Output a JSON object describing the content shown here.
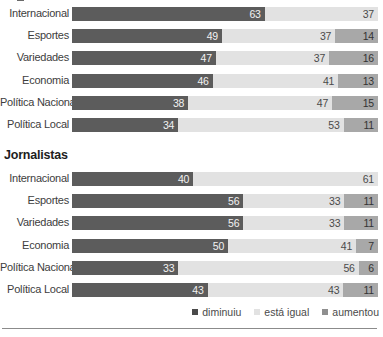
{
  "chart_data": {
    "type": "bar",
    "subtype": "stacked-horizontal-100",
    "title": "",
    "xlabel": "",
    "ylabel": "",
    "xlim": [
      0,
      100
    ],
    "grid": false,
    "legend_position": "bottom-right",
    "series": [
      {
        "name": "diminuiu",
        "key": "diminuiu",
        "color": "#5c5c5c"
      },
      {
        "name": "está igual",
        "key": "esta_igual",
        "color": "#e2e2e2"
      },
      {
        "name": "aumentou",
        "key": "aumentou",
        "color": "#a8a8a8"
      }
    ],
    "groups": [
      {
        "heading": "",
        "categories": [
          "Internacional",
          "Esportes",
          "Variedades",
          "Economia",
          "Política Nacional",
          "Política Local"
        ],
        "rows": [
          {
            "category": "Internacional",
            "diminuiu": 63,
            "esta_igual": 37,
            "aumentou": null
          },
          {
            "category": "Esportes",
            "diminuiu": 49,
            "esta_igual": 37,
            "aumentou": 14
          },
          {
            "category": "Variedades",
            "diminuiu": 47,
            "esta_igual": 37,
            "aumentou": 16
          },
          {
            "category": "Economia",
            "diminuiu": 46,
            "esta_igual": 41,
            "aumentou": 13
          },
          {
            "category": "Política Nacional",
            "diminuiu": 38,
            "esta_igual": 47,
            "aumentou": 15
          },
          {
            "category": "Política Local",
            "diminuiu": 34,
            "esta_igual": 53,
            "aumentou": 11
          }
        ]
      },
      {
        "heading": "Jornalistas",
        "categories": [
          "Internacional",
          "Esportes",
          "Variedades",
          "Economia",
          "Política Nacional",
          "Política Local"
        ],
        "rows": [
          {
            "category": "Internacional",
            "diminuiu": 40,
            "esta_igual": 61,
            "aumentou": null
          },
          {
            "category": "Esportes",
            "diminuiu": 56,
            "esta_igual": 33,
            "aumentou": 11
          },
          {
            "category": "Variedades",
            "diminuiu": 56,
            "esta_igual": 33,
            "aumentou": 11
          },
          {
            "category": "Economia",
            "diminuiu": 50,
            "esta_igual": 41,
            "aumentou": 7
          },
          {
            "category": "Política Nacional",
            "diminuiu": 33,
            "esta_igual": 56,
            "aumentou": 6
          },
          {
            "category": "Política Local",
            "diminuiu": 43,
            "esta_igual": 43,
            "aumentou": 11
          }
        ]
      }
    ]
  },
  "legend": {
    "items": [
      {
        "label": "diminuiu",
        "swatch": "legend-swatch-diminuiu"
      },
      {
        "label": "está igual",
        "swatch": "legend-swatch-esta-igual"
      },
      {
        "label": "aumentou",
        "swatch": "legend-swatch-aumentou"
      }
    ]
  },
  "group_headings": {
    "group_1": "",
    "group_2": "Jornalistas"
  }
}
